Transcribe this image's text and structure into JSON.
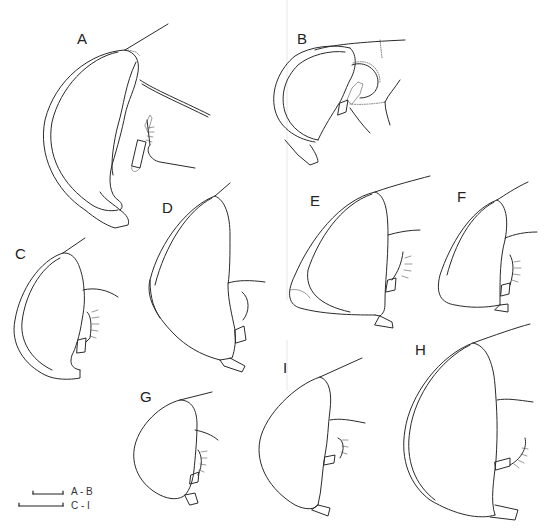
{
  "figure": {
    "panels": [
      {
        "id": "A",
        "label": "A"
      },
      {
        "id": "B",
        "label": "B"
      },
      {
        "id": "C",
        "label": "C"
      },
      {
        "id": "D",
        "label": "D"
      },
      {
        "id": "E",
        "label": "E"
      },
      {
        "id": "F",
        "label": "F"
      },
      {
        "id": "G",
        "label": "G"
      },
      {
        "id": "H",
        "label": "H"
      },
      {
        "id": "I",
        "label": "I"
      }
    ],
    "scale_bars": [
      {
        "label": "A - B"
      },
      {
        "label": "C - I"
      }
    ]
  }
}
